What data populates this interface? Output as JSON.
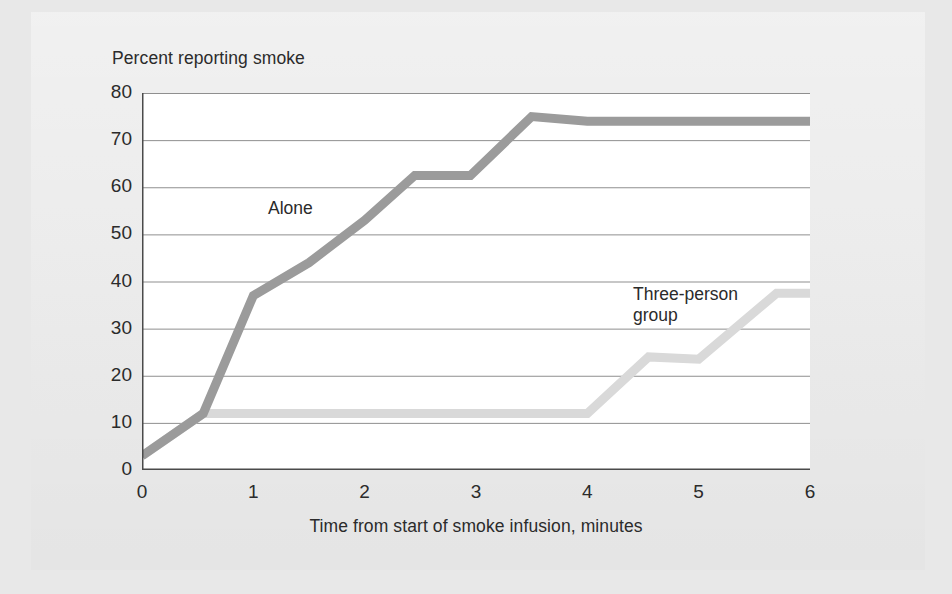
{
  "figure": {
    "y_axis_title": "Percent reporting smoke",
    "x_axis_title": "Time from start of smoke infusion, minutes",
    "label_alone": "Alone",
    "label_group": "Three-person\ngroup",
    "colors": {
      "page_background": "#e8e8e8",
      "card_background": "#ececec",
      "plot_background": "#ffffff",
      "axis": "#4a4a4a",
      "gridline": "#8f8f8f",
      "series_alone": "#9b9b9b",
      "series_group": "#d9d9d9",
      "text": "#2b2b2b"
    }
  },
  "chart_data": {
    "type": "line",
    "title": "",
    "subtitle": "",
    "xlabel": "Time from start of smoke infusion, minutes",
    "ylabel": "Percent reporting smoke",
    "xlim": [
      0,
      6
    ],
    "ylim": [
      0,
      80
    ],
    "xticks": [
      0,
      1,
      2,
      3,
      4,
      5,
      6
    ],
    "yticks": [
      0,
      10,
      20,
      30,
      40,
      50,
      60,
      70,
      80
    ],
    "xtick_labels": [
      "0",
      "1",
      "2",
      "3",
      "4",
      "5",
      "6"
    ],
    "ytick_labels": [
      "0",
      "10",
      "20",
      "30",
      "40",
      "50",
      "60",
      "70",
      "80"
    ],
    "grid": "horizontal",
    "legend": "inline-annotations",
    "series": [
      {
        "name": "Alone",
        "color": "#9b9b9b",
        "x": [
          0.0,
          0.55,
          1.0,
          1.5,
          2.0,
          2.45,
          2.95,
          3.5,
          4.0,
          6.0
        ],
        "values": [
          3,
          12,
          37,
          44,
          53,
          62.5,
          62.5,
          75,
          74,
          74
        ]
      },
      {
        "name": "Three-person group",
        "color": "#d9d9d9",
        "x": [
          0.0,
          0.55,
          4.0,
          4.55,
          5.0,
          5.7,
          6.0
        ],
        "values": [
          3,
          12,
          12,
          24,
          23.5,
          37.5,
          37.5
        ]
      }
    ]
  }
}
